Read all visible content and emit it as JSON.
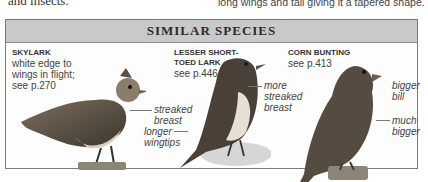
{
  "page": {
    "top_left_text": "and insects.",
    "top_right_text": "long wings and tail giving it a tapered shape."
  },
  "box": {
    "title": "SIMILAR SPECIES",
    "colors": {
      "header_bg": "#c9c9c9",
      "border": "#7a7a7a",
      "body_bg": "#fdfdfd"
    }
  },
  "species": [
    {
      "name": "SKYLARK",
      "description_lines": [
        "white edge to",
        "wings in flight;",
        "see p.270"
      ],
      "annotations": [
        {
          "lines": [
            "streaked",
            "breast"
          ]
        },
        {
          "lines": [
            "longer",
            "wingtips"
          ]
        }
      ]
    },
    {
      "name_lines": [
        "LESSER SHORT-",
        "TOED LARK"
      ],
      "description_lines": [
        "see p.446"
      ],
      "annotations": [
        {
          "lines": [
            "more",
            "streaked",
            "breast"
          ]
        }
      ]
    },
    {
      "name": "CORN BUNTING",
      "description_lines": [
        "see p.413"
      ],
      "annotations": [
        {
          "lines": [
            "bigger",
            "bill"
          ]
        },
        {
          "lines": [
            "much",
            "bigger"
          ]
        }
      ]
    }
  ],
  "icons": [
    "skylark-illustration",
    "lesser-short-toed-lark-illustration",
    "corn-bunting-illustration"
  ]
}
